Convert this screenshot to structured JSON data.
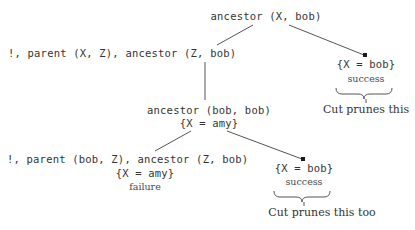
{
  "figure": {
    "type": "prolog-search-tree",
    "nodes": {
      "root_goal": "ancestor (X, bob)",
      "level1_left_goal": "!, parent (X, Z), ancestor (Z, bob)",
      "level1_right_binding": "{X = bob}",
      "level1_right_status": "success",
      "level2_goal": "ancestor (bob, bob)",
      "level2_binding": "{X = amy}",
      "level3_left_goal": "!, parent (bob, Z), ancestor (Z, bob)",
      "level3_left_binding": "{X = amy}",
      "level3_left_status": "failure",
      "level3_right_binding": "{X = bob}",
      "level3_right_status": "success"
    },
    "captions": {
      "upper": "Cut prunes this",
      "lower": "Cut prunes this too"
    },
    "colors": {
      "background": "#ffffff",
      "text": "#333333",
      "line": "#555555",
      "marker": "#1a1a1a"
    }
  }
}
